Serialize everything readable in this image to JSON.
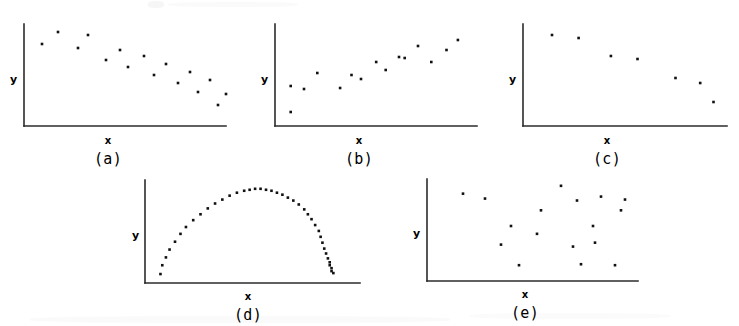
{
  "figure": {
    "axis_labels": {
      "x": "x",
      "y": "y"
    },
    "captions": [
      "(a)",
      "(b)",
      "(c)",
      "(d)",
      "(e)"
    ]
  },
  "chart_data": [
    {
      "type": "scatter",
      "title": "(a)",
      "xlabel": "x",
      "ylabel": "y",
      "grid": false,
      "legend": false,
      "xlim": [
        0,
        100
      ],
      "ylim": [
        0,
        100
      ],
      "relationship": "strong negative linear correlation",
      "n_points": 16,
      "x": [
        4,
        12,
        22,
        27,
        36,
        43,
        47,
        55,
        60,
        66,
        72,
        78,
        82,
        88,
        92,
        96
      ],
      "y": [
        76,
        88,
        72,
        85,
        60,
        70,
        53,
        64,
        45,
        56,
        37,
        48,
        28,
        40,
        15,
        26
      ]
    },
    {
      "type": "scatter",
      "title": "(b)",
      "xlabel": "x",
      "ylabel": "y",
      "grid": false,
      "legend": false,
      "xlim": [
        0,
        100
      ],
      "ylim": [
        0,
        100
      ],
      "relationship": "positive linear correlation",
      "n_points": 15,
      "x": [
        3,
        3,
        10,
        17,
        29,
        35,
        40,
        48,
        53,
        60,
        63,
        70,
        77,
        85,
        91
      ],
      "y": [
        8,
        34,
        31,
        47,
        32,
        45,
        41,
        58,
        50,
        63,
        62,
        74,
        58,
        70,
        80
      ]
    },
    {
      "type": "scatter",
      "title": "(c)",
      "xlabel": "x",
      "ylabel": "y",
      "grid": false,
      "legend": false,
      "xlim": [
        0,
        100
      ],
      "ylim": [
        0,
        100
      ],
      "relationship": "negative linear correlation, few observations",
      "n_points": 7,
      "x": [
        10,
        24,
        41,
        55,
        75,
        88,
        95
      ],
      "y": [
        85,
        82,
        64,
        61,
        42,
        37,
        18
      ]
    },
    {
      "type": "scatter",
      "title": "(d)",
      "xlabel": "x",
      "ylabel": "y",
      "grid": false,
      "legend": false,
      "xlim": [
        0,
        100
      ],
      "ylim": [
        0,
        100
      ],
      "relationship": "strong nonlinear (curvilinear, dome shaped) relationship",
      "n_points": 40,
      "x": [
        3,
        4,
        6,
        8,
        11,
        14,
        17,
        21,
        25,
        29,
        33,
        37,
        41,
        45,
        49,
        52,
        55,
        58,
        61,
        64,
        67,
        70,
        73,
        76,
        79,
        82,
        84,
        86,
        88,
        90,
        91,
        92,
        93,
        94,
        95,
        96,
        96,
        97,
        97,
        98
      ],
      "y": [
        3,
        12,
        20,
        28,
        36,
        44,
        51,
        58,
        64,
        70,
        75,
        79,
        83,
        86,
        88,
        89,
        90,
        90,
        89,
        88,
        86,
        84,
        81,
        78,
        74,
        69,
        64,
        59,
        53,
        47,
        41,
        35,
        29,
        24,
        19,
        15,
        12,
        9,
        6,
        4
      ]
    },
    {
      "type": "scatter",
      "title": "(e)",
      "xlabel": "x",
      "ylabel": "y",
      "grid": false,
      "legend": false,
      "xlim": [
        0,
        100
      ],
      "ylim": [
        0,
        100
      ],
      "relationship": "no relationship / random scatter",
      "n_points": 17,
      "x": [
        13,
        24,
        32,
        37,
        41,
        50,
        52,
        62,
        68,
        70,
        72,
        78,
        79,
        82,
        89,
        92,
        94
      ],
      "y": [
        83,
        78,
        31,
        50,
        10,
        42,
        66,
        91,
        29,
        76,
        11,
        50,
        33,
        80,
        10,
        66,
        77
      ]
    }
  ]
}
